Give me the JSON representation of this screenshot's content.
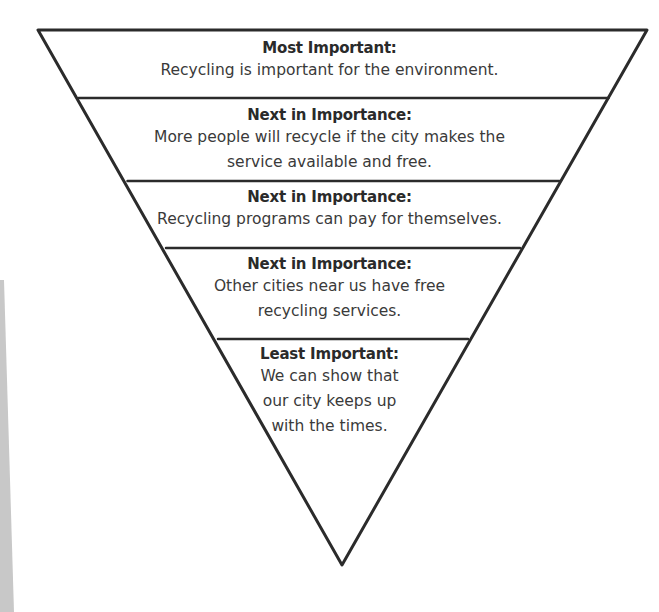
{
  "diagram": {
    "type": "inverted-pyramid",
    "colors": {
      "line": "#2b2b2b",
      "text": "#333333",
      "background": "#ffffff",
      "edge_shadow": "#c8c8c8"
    },
    "tiers": [
      {
        "heading": "Most Important:",
        "body": "Recycling is important for the environment."
      },
      {
        "heading": "Next in Importance:",
        "body": "More people will recycle if the city makes the\nservice available and free."
      },
      {
        "heading": "Next in Importance:",
        "body": "Recycling programs can pay for themselves."
      },
      {
        "heading": "Next in Importance:",
        "body": "Other cities near us have free\nrecycling services."
      },
      {
        "heading": "Least Important:",
        "body": "We can show that\nour city keeps up\nwith the times."
      }
    ]
  }
}
